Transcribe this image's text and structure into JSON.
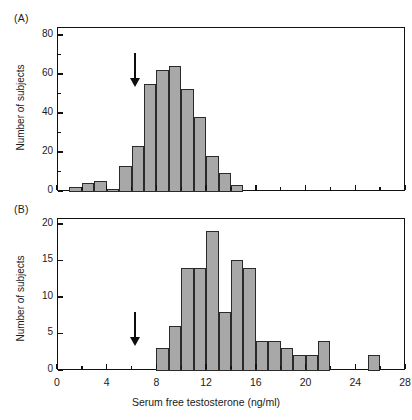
{
  "figure": {
    "xlabel": "Serum free testosterone (ng/ml)",
    "ylabel_a": "Number of subjects",
    "ylabel_b": "Number of subjects",
    "panel_a_label": "(A)",
    "panel_b_label": "(B)",
    "bar_color": "#a8a8a8",
    "bar_edge_color": "#2a2a2a",
    "axis_color": "#111111",
    "arrow_color": "#0d0d0d"
  },
  "chart_data": [
    {
      "type": "bar",
      "title": "(A)",
      "xlabel": "Serum free testosterone (ng/ml)",
      "ylabel": "Number of subjects",
      "xlim": [
        0,
        28
      ],
      "ylim": [
        0,
        84
      ],
      "xticks": [
        0,
        4,
        8,
        12,
        16,
        20,
        24,
        28
      ],
      "xticklabels": [
        "",
        "",
        "",
        "",
        "",
        "",
        "",
        ""
      ],
      "yticks": [
        0,
        20,
        40,
        60,
        80
      ],
      "yticklabels": [
        "0",
        "20",
        "40",
        "60",
        "80"
      ],
      "yminor": [
        10,
        30,
        50,
        70
      ],
      "xminor": [
        2,
        6,
        10,
        14,
        18,
        22,
        26
      ],
      "grid": false,
      "legend": null,
      "bin_width": 1,
      "bin_starts": [
        1,
        2,
        3,
        4,
        5,
        6,
        7,
        8,
        9,
        10,
        11,
        12,
        13,
        14
      ],
      "values": [
        2,
        4,
        5,
        1,
        13,
        23,
        55,
        62,
        64,
        52,
        38,
        18,
        9,
        3
      ],
      "annotation": {
        "type": "arrow",
        "x": 6.3,
        "label": "arrow-marker"
      }
    },
    {
      "type": "bar",
      "title": "(B)",
      "xlabel": "Serum free testosterone (ng/ml)",
      "ylabel": "Number of subjects",
      "xlim": [
        0,
        28
      ],
      "ylim": [
        0,
        20.8
      ],
      "xticks": [
        0,
        4,
        8,
        12,
        16,
        20,
        24,
        28
      ],
      "xticklabels": [
        "0",
        "4",
        "8",
        "12",
        "16",
        "20",
        "24",
        "28"
      ],
      "yticks": [
        0,
        5,
        10,
        15,
        20
      ],
      "yticklabels": [
        "0",
        "5",
        "10",
        "15",
        "20"
      ],
      "yminor": [],
      "xminor": [
        2,
        6,
        10,
        14,
        18,
        22,
        26
      ],
      "grid": false,
      "legend": null,
      "bin_width": 1,
      "bin_starts": [
        8,
        9,
        10,
        11,
        12,
        13,
        14,
        15,
        16,
        17,
        18,
        19,
        20,
        21,
        25
      ],
      "values": [
        3,
        6,
        14,
        14,
        19,
        8,
        15,
        14,
        4,
        4,
        3,
        2,
        2,
        4,
        2
      ],
      "annotation": {
        "type": "arrow",
        "x": 6.3,
        "label": "arrow-marker"
      }
    }
  ]
}
